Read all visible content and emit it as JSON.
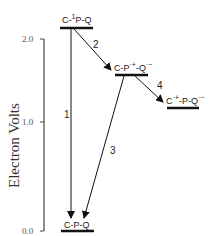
{
  "diagram": {
    "type": "energy-level",
    "axis": {
      "label": "Electron Volts",
      "ticks": [
        "2.0",
        "1.0",
        "0.0"
      ]
    },
    "states": [
      {
        "id": "s1",
        "base": "C-",
        "sup": "1",
        "rest": "P-Q",
        "energy_ev": 2.0
      },
      {
        "id": "s2",
        "base": "C-P",
        "sup": "·+",
        "rest": "-Q",
        "sup2": "·−",
        "energy_ev": 1.4
      },
      {
        "id": "s3",
        "base": "C",
        "sup": "·+",
        "rest": "-P-Q",
        "sup2": "·−",
        "energy_ev": 1.1
      },
      {
        "id": "s4",
        "base": "C-P-Q",
        "energy_ev": 0.0
      }
    ],
    "transitions": [
      {
        "label": "1",
        "from": "s1",
        "to": "s4"
      },
      {
        "label": "2",
        "from": "s1",
        "to": "s2"
      },
      {
        "label": "3",
        "from": "s2",
        "to": "s4"
      },
      {
        "label": "4",
        "from": "s2",
        "to": "s3"
      }
    ]
  }
}
